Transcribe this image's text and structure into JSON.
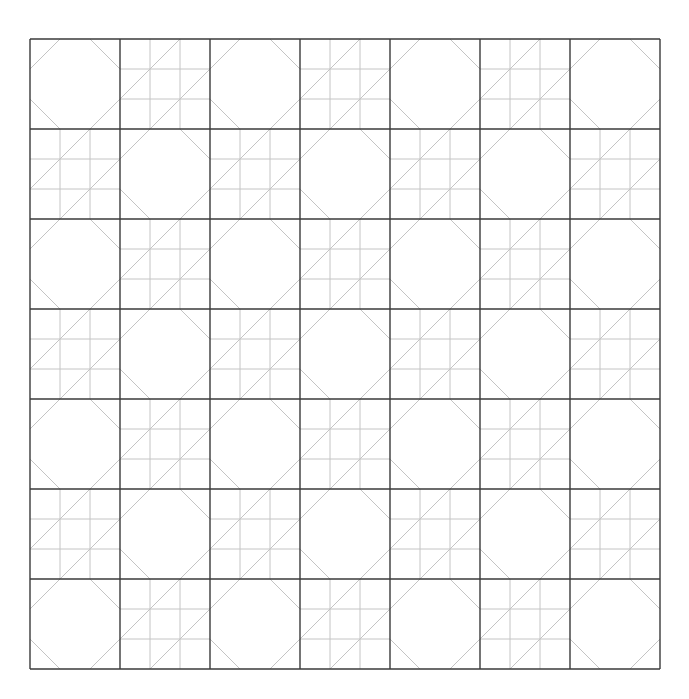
{
  "diagram": {
    "rows": 7,
    "cols": 7,
    "block_types": {
      "even": "snowball-octagon",
      "odd": "nine-patch-diagonal"
    },
    "subdivisions": 3,
    "colors": {
      "block_outline": "#3a3a3a",
      "seam_line": "#c4c4c4",
      "background": "#ffffff"
    }
  }
}
